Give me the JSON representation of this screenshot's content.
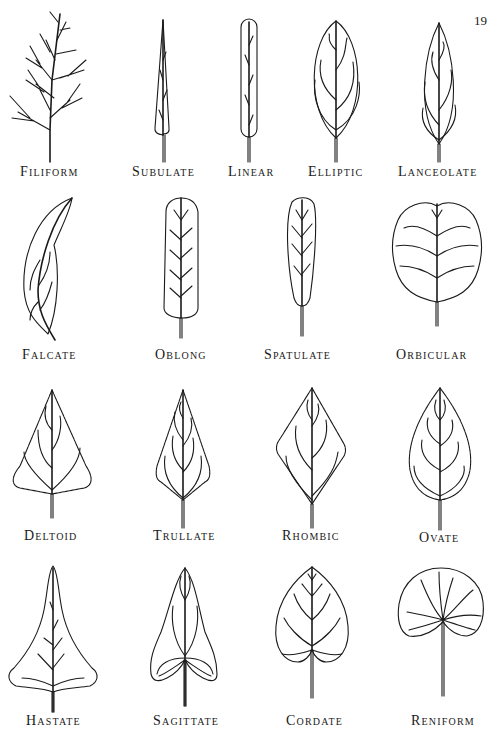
{
  "page": {
    "number": "19"
  },
  "figure": {
    "rows": [
      [
        "Filiform",
        "Subulate",
        "Linear",
        "Elliptic",
        "Lanceolate"
      ],
      [
        "Falcate",
        "Oblong",
        "Spatulate",
        "Orbicular"
      ],
      [
        "Deltoid",
        "Trullate",
        "Rhombic",
        "Ovate"
      ],
      [
        "Hastate",
        "Sagittate",
        "Cordate",
        "Reniform"
      ]
    ],
    "labels": {
      "filiform": "Filiform",
      "subulate": "Subulate",
      "linear": "Linear",
      "elliptic": "Elliptic",
      "lanceolate": "Lanceolate",
      "falcate": "Falcate",
      "oblong": "Oblong",
      "spatulate": "Spatulate",
      "orbicular": "Orbicular",
      "deltoid": "Deltoid",
      "trullate": "Trullate",
      "rhombic": "Rhombic",
      "ovate": "Ovate",
      "hastate": "Hastate",
      "sagittate": "Sagittate",
      "cordate": "Cordate",
      "reniform": "Reniform"
    }
  }
}
